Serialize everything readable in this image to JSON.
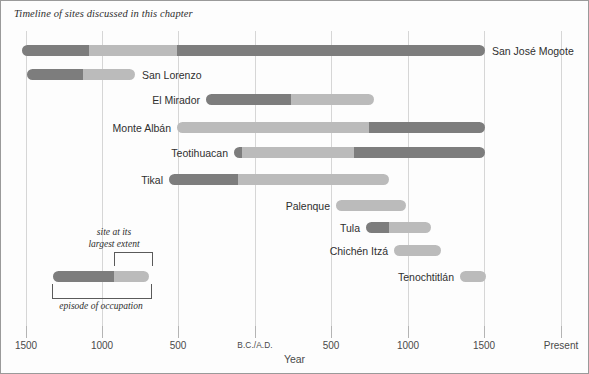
{
  "caption": "Timeline of sites discussed in this chapter",
  "axis": {
    "title": "Year",
    "ticks": [
      {
        "label": "1500",
        "x": 25
      },
      {
        "label": "1000",
        "x": 101
      },
      {
        "label": "500",
        "x": 177
      },
      {
        "label": "B.C./A.D.",
        "x": 254
      },
      {
        "label": "500",
        "x": 330
      },
      {
        "label": "1000",
        "x": 407
      },
      {
        "label": "1500",
        "x": 483
      },
      {
        "label": "Present",
        "x": 560
      }
    ]
  },
  "legend": {
    "top_label_line1": "site at its",
    "top_label_line2": "largest extent",
    "bottom_label": "episode of occupation"
  },
  "colors": {
    "dark": "#7d7d7d",
    "light": "#bbbbbb",
    "grid": "#d6d6d6",
    "frame": "#9a9a9a",
    "text": "#2f2f2f"
  },
  "chart_data": {
    "type": "bar",
    "title": "Timeline of sites discussed in this chapter",
    "xlabel": "Year",
    "ylabel": "",
    "orientation": "horizontal",
    "xlim": [
      -1800,
      2000
    ],
    "x_tick_labels": [
      "1500",
      "1000",
      "500",
      "B.C./A.D.",
      "500",
      "1000",
      "1500",
      "Present"
    ],
    "x_tick_values": [
      -1500,
      -1000,
      -500,
      0,
      500,
      1000,
      1500,
      2000
    ],
    "grid": true,
    "legend_position": "inside-lower-left",
    "series_note": "Each bar is an episode of occupation; the darker segment marks the site at its largest extent.",
    "categories": [
      "San José Mogote",
      "San Lorenzo",
      "El Mirador",
      "Monte Albán",
      "Teotihuacan",
      "Tikal",
      "Palenque",
      "Tula",
      "Chichén Itzá",
      "Tenochtitlán"
    ],
    "bars": [
      {
        "label": "San José Mogote",
        "label_side": "right",
        "row_y": 44,
        "start_px": 21,
        "end_px": 484,
        "start_year": -1470,
        "end_year": 1500,
        "segments": [
          {
            "tone": "dark",
            "from_px": 21,
            "to_px": 88
          },
          {
            "tone": "light",
            "from_px": 88,
            "to_px": 176
          },
          {
            "tone": "dark",
            "from_px": 176,
            "to_px": 484
          }
        ],
        "peak_years": [
          [
            -1470,
            -1040
          ],
          [
            -500,
            1500
          ]
        ]
      },
      {
        "label": "San Lorenzo",
        "label_side": "right",
        "row_y": 68,
        "start_px": 26,
        "end_px": 134,
        "start_year": -1440,
        "end_year": -740,
        "segments": [
          {
            "tone": "dark",
            "from_px": 26,
            "to_px": 82
          },
          {
            "tone": "light",
            "from_px": 82,
            "to_px": 134
          }
        ],
        "peak_years": [
          [
            -1440,
            -1080
          ]
        ]
      },
      {
        "label": "El Mirador",
        "label_side": "left",
        "row_y": 93,
        "start_px": 205,
        "end_px": 373,
        "start_year": -320,
        "end_year": 780,
        "segments": [
          {
            "tone": "dark",
            "from_px": 205,
            "to_px": 290
          },
          {
            "tone": "light",
            "from_px": 290,
            "to_px": 373
          }
        ],
        "peak_years": [
          [
            -320,
            235
          ]
        ]
      },
      {
        "label": "Monte Albán",
        "label_side": "left",
        "row_y": 121,
        "start_px": 176,
        "end_px": 484,
        "start_year": -510,
        "end_year": 1500,
        "segments": [
          {
            "tone": "light",
            "from_px": 176,
            "to_px": 368
          },
          {
            "tone": "dark",
            "from_px": 368,
            "to_px": 484
          }
        ],
        "peak_years": [
          [
            745,
            1500
          ]
        ]
      },
      {
        "label": "Teotihuacan",
        "label_side": "left",
        "row_y": 146,
        "start_px": 233,
        "end_px": 484,
        "start_year": -140,
        "end_year": 1500,
        "segments": [
          {
            "tone": "dark",
            "from_px": 233,
            "to_px": 241
          },
          {
            "tone": "light",
            "from_px": 241,
            "to_px": 353
          },
          {
            "tone": "dark",
            "from_px": 353,
            "to_px": 484
          }
        ],
        "peak_years": [
          [
            -140,
            -90
          ],
          [
            645,
            1500
          ]
        ]
      },
      {
        "label": "Tikal",
        "label_side": "left",
        "row_y": 173,
        "start_px": 168,
        "end_px": 388,
        "start_year": -560,
        "end_year": 875,
        "segments": [
          {
            "tone": "dark",
            "from_px": 168,
            "to_px": 237
          },
          {
            "tone": "light",
            "from_px": 237,
            "to_px": 388
          }
        ],
        "peak_years": [
          [
            -560,
            -110
          ]
        ]
      },
      {
        "label": "Palenque",
        "label_side": "left",
        "row_y": 199,
        "start_px": 335,
        "end_px": 405,
        "start_year": 530,
        "end_year": 985,
        "segments": [
          {
            "tone": "light",
            "from_px": 335,
            "to_px": 405
          }
        ],
        "peak_years": []
      },
      {
        "label": "Tula",
        "label_side": "left",
        "row_y": 221,
        "start_px": 365,
        "end_px": 430,
        "start_year": 725,
        "end_year": 1150,
        "segments": [
          {
            "tone": "dark",
            "from_px": 365,
            "to_px": 388
          },
          {
            "tone": "light",
            "from_px": 388,
            "to_px": 430
          }
        ],
        "peak_years": [
          [
            725,
            875
          ]
        ]
      },
      {
        "label": "Chichén Itzá",
        "label_side": "left",
        "row_y": 244,
        "start_px": 393,
        "end_px": 440,
        "start_year": 910,
        "end_year": 1215,
        "segments": [
          {
            "tone": "light",
            "from_px": 393,
            "to_px": 440
          }
        ],
        "peak_years": []
      },
      {
        "label": "Tenochtitlán",
        "label_side": "left",
        "row_y": 270,
        "start_px": 459,
        "end_px": 485,
        "start_year": 1340,
        "end_year": 1510,
        "segments": [
          {
            "tone": "light",
            "from_px": 459,
            "to_px": 485
          }
        ],
        "peak_years": []
      }
    ],
    "legend_example": {
      "start_px": 52,
      "end_px": 148,
      "split_px": 113,
      "row_y": 270
    }
  }
}
